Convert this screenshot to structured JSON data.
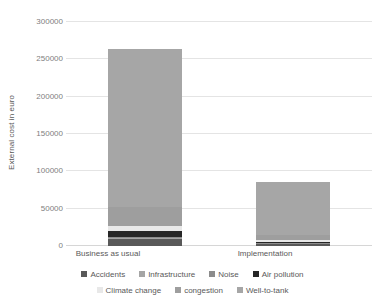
{
  "chart_data": {
    "type": "bar",
    "subtype": "stacked",
    "title": "",
    "xlabel": "",
    "ylabel": "External cost in euro",
    "categories": [
      "Business as usual",
      "Implementation"
    ],
    "ylim": [
      0,
      300000
    ],
    "yticks": [
      0,
      50000,
      100000,
      150000,
      200000,
      250000,
      300000
    ],
    "ytick_labels": [
      "0",
      "50000",
      "100000",
      "150000",
      "200000",
      "250000",
      "300000"
    ],
    "grid": true,
    "legend_position": "bottom",
    "series": [
      {
        "name": "Accidents",
        "color": "#595959",
        "values": [
          9000,
          2500
        ]
      },
      {
        "name": "Infrastructure",
        "color": "#a5a5a5",
        "values": [
          1500,
          600
        ]
      },
      {
        "name": "Noise",
        "color": "#8c8c8c",
        "values": [
          1200,
          500
        ]
      },
      {
        "name": "Air pollution",
        "color": "#262626",
        "values": [
          8000,
          2200
        ]
      },
      {
        "name": "Climate change",
        "color": "#e8e8e8",
        "values": [
          7000,
          1800
        ]
      },
      {
        "name": "congestion",
        "color": "#9e9e9e",
        "values": [
          25000,
          7000
        ]
      },
      {
        "name": "Well-to-tank",
        "color": "#a6a6a6",
        "values": [
          212300,
          71400
        ]
      }
    ],
    "totals": [
      264000,
      86000
    ]
  },
  "axis": {
    "y_title": "External cost in euro"
  },
  "colors": {
    "gridline": "#e4e4e4",
    "text": "#595959",
    "tick_text": "#808080",
    "background": "#ffffff"
  }
}
